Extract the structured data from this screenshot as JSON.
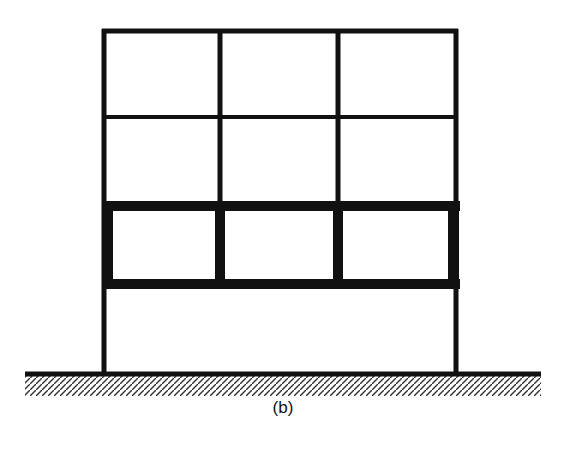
{
  "figure": {
    "caption": "(b)",
    "colors": {
      "stroke": "#111111",
      "background": "#ffffff",
      "hatch": "#333333"
    }
  },
  "frame": {
    "bays": 3,
    "storeys": 4,
    "columns_x": [
      104,
      220,
      338,
      456
    ],
    "levels_y": [
      31,
      117,
      206,
      284,
      373
    ],
    "stiff_storey_index": 2
  }
}
